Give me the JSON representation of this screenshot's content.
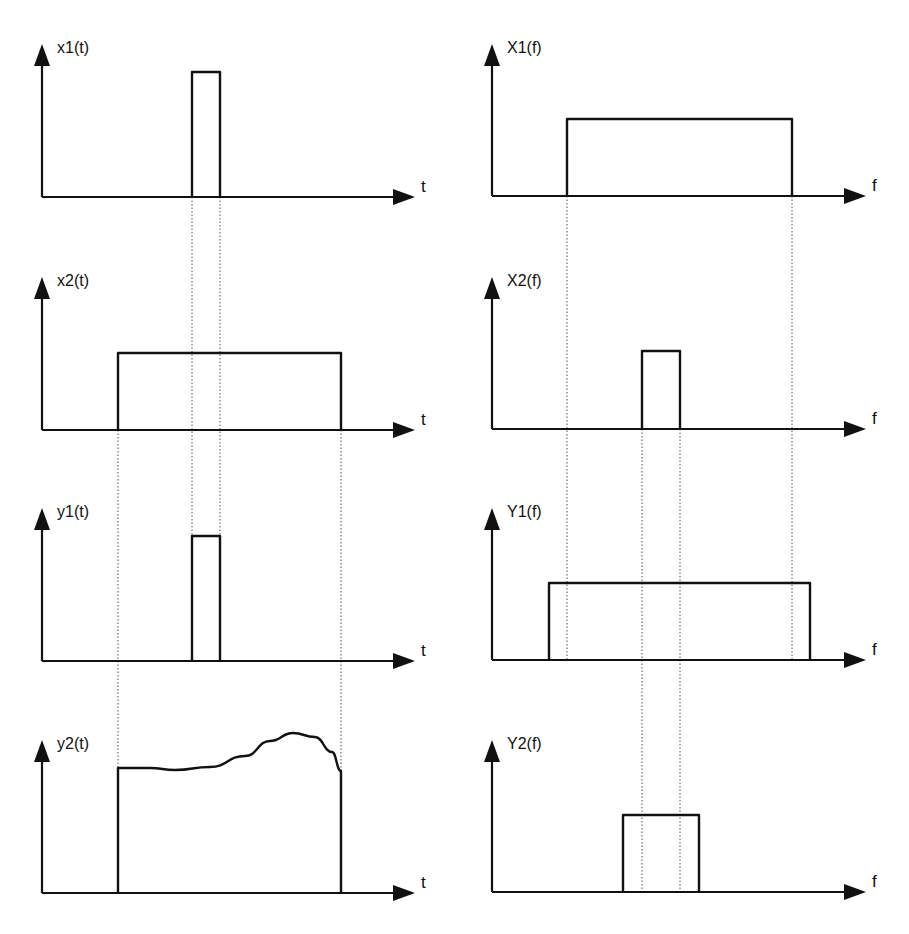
{
  "figure": {
    "ink_color": "#111111",
    "guide_color": "#555555",
    "background": "#ffffff"
  },
  "panels": [
    {
      "id": "x1t",
      "label": "x1(t)",
      "axis_var": "t",
      "column": "time",
      "row": 0
    },
    {
      "id": "X1f",
      "label": "X1(f)",
      "axis_var": "f",
      "column": "frequency",
      "row": 0
    },
    {
      "id": "x2t",
      "label": "x2(t)",
      "axis_var": "t",
      "column": "time",
      "row": 1
    },
    {
      "id": "X2f",
      "label": "X2(f)",
      "axis_var": "f",
      "column": "frequency",
      "row": 1
    },
    {
      "id": "y1t",
      "label": "y1(t)",
      "axis_var": "t",
      "column": "time",
      "row": 2
    },
    {
      "id": "Y1f",
      "label": "Y1(f)",
      "axis_var": "f",
      "column": "frequency",
      "row": 2
    },
    {
      "id": "y2t",
      "label": "y2(t)",
      "axis_var": "t",
      "column": "time",
      "row": 3
    },
    {
      "id": "Y2f",
      "label": "Y2(f)",
      "axis_var": "f",
      "column": "frequency",
      "row": 3
    }
  ],
  "geometry": {
    "time_axis": {
      "x0": 42,
      "x_end": 415
    },
    "freq_axis": {
      "x0": 492,
      "x_end": 866
    },
    "rows": [
      {
        "baseline": 197,
        "axis_top": 44,
        "label_y": 53
      },
      {
        "baseline": 430,
        "axis_top": 277,
        "label_y": 286
      },
      {
        "baseline": 661,
        "axis_top": 508,
        "label_y": 517
      },
      {
        "baseline": 893,
        "axis_top": 740,
        "label_y": 749
      }
    ],
    "shapes": {
      "x1t": {
        "type": "rect",
        "x1": 192,
        "x2": 220,
        "top": 72
      },
      "X1f": {
        "type": "rect",
        "x1": 567,
        "x2": 792,
        "top": 119
      },
      "x2t": {
        "type": "rect",
        "x1": 118,
        "x2": 341,
        "top": 353
      },
      "X2f": {
        "type": "rect",
        "x1": 642,
        "x2": 680,
        "top": 351
      },
      "y1t": {
        "type": "rect",
        "x1": 192,
        "x2": 220,
        "top": 536
      },
      "Y1f": {
        "type": "rect",
        "x1": 549,
        "x2": 810,
        "top": 583
      },
      "y2t": {
        "type": "curve",
        "x1": 118,
        "x2": 341,
        "points": [
          [
            118,
            768
          ],
          [
            150,
            768
          ],
          [
            175,
            770
          ],
          [
            210,
            767
          ],
          [
            245,
            756
          ],
          [
            270,
            741
          ],
          [
            293,
            733
          ],
          [
            315,
            737
          ],
          [
            332,
            752
          ],
          [
            341,
            771
          ]
        ]
      },
      "Y2f": {
        "type": "rect",
        "x1": 623,
        "x2": 699,
        "top": 815
      }
    },
    "guides": [
      {
        "x": 192,
        "y1": 197,
        "y2": 536
      },
      {
        "x": 220,
        "y1": 197,
        "y2": 536
      },
      {
        "x": 118,
        "y1": 430,
        "y2": 768
      },
      {
        "x": 341,
        "y1": 430,
        "y2": 771
      },
      {
        "x": 567,
        "y1": 196,
        "y2": 660
      },
      {
        "x": 792,
        "y1": 196,
        "y2": 660
      },
      {
        "x": 642,
        "y1": 429,
        "y2": 892
      },
      {
        "x": 680,
        "y1": 429,
        "y2": 892
      }
    ]
  }
}
